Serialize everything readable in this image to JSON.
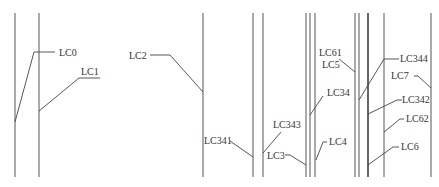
{
  "diagram": {
    "title": "",
    "caption": "",
    "labels": {
      "lc0": "LC0",
      "lc1": "LC1",
      "lc2": "LC2",
      "lc341": "LC341",
      "lc343": "LC343",
      "lc3": "LC3",
      "lc34": "LC34",
      "lc4": "LC4",
      "lc61": "LC61",
      "lc5": "LC5",
      "lc344": "LC344",
      "lc7": "LC7",
      "lc342": "LC342",
      "lc62": "LC62",
      "lc6": "LC6"
    },
    "vertical_lines_x": [
      15,
      39,
      203,
      253,
      263,
      306,
      310,
      315,
      355,
      359,
      368,
      384,
      431
    ],
    "line_top_y": 13,
    "line_bottom_y": 177,
    "colors": {
      "line": "#555555",
      "text": "#333333",
      "background": "#ffffff"
    }
  }
}
